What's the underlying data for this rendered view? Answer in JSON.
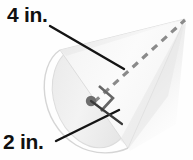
{
  "figure": {
    "name": "cone-with-dimensions",
    "shape": "cone",
    "labels": {
      "slant_height": "4 in.",
      "radius": "2 in."
    },
    "colors": {
      "background": "#fefefe",
      "cone_fill": "#f2f2f2",
      "cone_fill_light": "#fafafa",
      "cone_shadow": "#d9d9d9",
      "outline": "#d0d0d0",
      "leader_line": "#1a1a1a",
      "dashed_line": "#8c8c8c",
      "center_dot": "#6e6e6e",
      "text": "#101010"
    },
    "geometry": {
      "apex": [
        185,
        19
      ],
      "base_center": [
        92,
        101
      ],
      "base_major_top": [
        57,
        46
      ],
      "base_major_bottom": [
        128,
        148
      ],
      "leader_slant_start": [
        50,
        26
      ],
      "leader_slant_end": [
        122,
        68
      ],
      "leader_radius_start": [
        57,
        140
      ],
      "leader_radius_end": [
        118,
        111
      ]
    },
    "annotations": {
      "right_angle_marker": "right-angle-square",
      "center_point": "base-center-dot",
      "slant_line_style": "dashed",
      "radius_line_style": "solid"
    }
  }
}
